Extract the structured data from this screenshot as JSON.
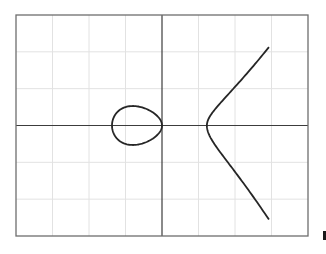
{
  "chart_data": {
    "type": "line",
    "title": "",
    "xlabel": "",
    "ylabel": "",
    "xlim": [
      -4,
      4
    ],
    "ylim": [
      -3,
      3
    ],
    "grid": true,
    "grid_step": 1,
    "roots": [
      -1.37,
      0,
      1.23
    ],
    "x_range_plotted": [
      -1.37,
      2.93
    ],
    "components": [
      {
        "name": "oval",
        "x_range": [
          -1.37,
          0
        ]
      },
      {
        "name": "unbounded-branch",
        "x_range": [
          1.23,
          2.93
        ],
        "endpoints": [
          [
            2.93,
            2.05
          ],
          [
            2.93,
            -2.5
          ]
        ]
      }
    ]
  },
  "colors": {
    "background": "#ffffff",
    "frame": "#6e6e6e",
    "grid": "#e2e2e2",
    "axis": "#3c3c3c",
    "curve": "#262626"
  }
}
